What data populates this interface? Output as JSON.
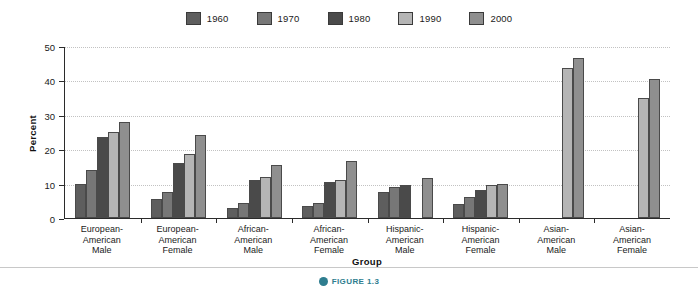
{
  "chart_data": {
    "type": "bar",
    "title": "",
    "xlabel": "Group",
    "ylabel": "Percent",
    "ylim": [
      0,
      50
    ],
    "yticks": [
      0,
      10,
      20,
      30,
      40,
      50
    ],
    "grid": true,
    "legend_position": "top-center",
    "categories": [
      "European-\nAmerican\nMale",
      "European-\nAmerican\nFemale",
      "African-\nAmerican\nMale",
      "African-\nAmerican\nFemale",
      "Hispanic-\nAmerican\nMale",
      "Hispanic-\nAmerican\nFemale",
      "Asian-\nAmerican\nMale",
      "Asian-\nAmerican\nFemale"
    ],
    "series": [
      {
        "name": "1960",
        "color": "#5e5e5e",
        "values": [
          10,
          5.5,
          3,
          3.5,
          7.5,
          4,
          null,
          null
        ]
      },
      {
        "name": "1970",
        "color": "#777777",
        "values": [
          14,
          7.5,
          4.5,
          4.5,
          9,
          6,
          null,
          null
        ]
      },
      {
        "name": "1980",
        "color": "#4a4a4a",
        "values": [
          23.5,
          16,
          11,
          10.5,
          9.5,
          8,
          null,
          null
        ]
      },
      {
        "name": "1990",
        "color": "#b5b5b5",
        "values": [
          25,
          18.5,
          12,
          11,
          null,
          9.5,
          43.5,
          35
        ]
      },
      {
        "name": "2000",
        "color": "#8f8f8f",
        "values": [
          28,
          24,
          15.5,
          16.5,
          11.5,
          10,
          46.5,
          40.5
        ]
      }
    ]
  },
  "legend": {
    "items": [
      {
        "label": "1960",
        "color": "#5e5e5e"
      },
      {
        "label": "1970",
        "color": "#777777"
      },
      {
        "label": "1980",
        "color": "#4a4a4a"
      },
      {
        "label": "1990",
        "color": "#b5b5b5"
      },
      {
        "label": "2000",
        "color": "#8f8f8f"
      }
    ]
  },
  "axes": {
    "y_title": "Percent",
    "x_title": "Group",
    "y_labels": [
      "50",
      "40",
      "30",
      "20",
      "10",
      "0"
    ]
  },
  "caption": {
    "badge": "figure-marker-icon",
    "text": "FIGURE 1.3"
  },
  "colors": {
    "axis": "#2b2b2b",
    "grid": "#c2c2c2",
    "bar_outline": "#4a4a4a",
    "caption_accent": "#2e7d8f"
  }
}
